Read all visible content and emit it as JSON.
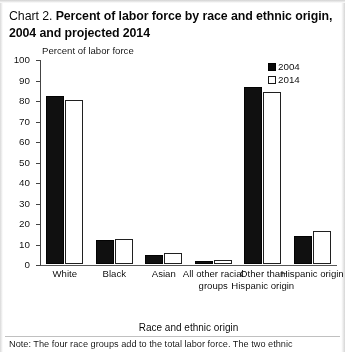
{
  "title": {
    "chart_label": "Chart 2.",
    "heading": "Percent of labor force by race and ethnic origin, 2004 and projected 2014"
  },
  "legend": {
    "items": [
      {
        "label": "2004",
        "style": "filled",
        "color": "#161616"
      },
      {
        "label": "2014",
        "style": "hollow",
        "color": "#ffffff"
      }
    ]
  },
  "footnote": "Note: The four race groups add to the total labor force.  The two ethnic",
  "chart_data": {
    "type": "bar",
    "title": "Chart 2.  Percent of labor force by race and ethnic origin, 2004 and projected 2014",
    "ylabel": "Percent of labor force",
    "xlabel": "Race and ethnic origin",
    "ylim": [
      0,
      100
    ],
    "yticks": [
      0,
      10,
      20,
      30,
      40,
      50,
      60,
      70,
      80,
      90,
      100
    ],
    "grid": false,
    "legend_position": "top-right",
    "categories": [
      "White",
      "Black",
      "Asian",
      "All other racial groups",
      "Other than Hispanic origin",
      "Hispanic origin"
    ],
    "series": [
      {
        "name": "2004",
        "values": [
          82,
          11.5,
          4.5,
          1.7,
          86.5,
          13.5
        ]
      },
      {
        "name": "2014",
        "values": [
          80,
          12,
          5.5,
          2,
          84,
          16
        ]
      }
    ]
  }
}
